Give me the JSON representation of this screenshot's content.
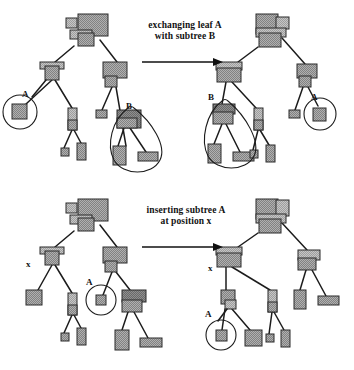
{
  "figure": {
    "background_color": "#ffffff",
    "ink_color": "#1c1c1c",
    "node_fill_light": "#b9b9b9",
    "node_fill_mid": "#a0a0a0",
    "node_fill_dark": "#8a8a8a"
  },
  "panels": [
    {
      "id": "exchange",
      "caption_line1": "exchanging leaf A",
      "caption_line2": "with subtree B",
      "arrow": "right-arrow",
      "labels_left": [
        "A",
        "B"
      ],
      "labels_right": [
        "B",
        "A"
      ],
      "annotations": [
        "circle-around-leaf-A",
        "teardrop-around-subtree-B"
      ]
    },
    {
      "id": "insert",
      "caption_line1": "inserting subtree A",
      "caption_line2": "at position x",
      "arrow": "right-arrow",
      "labels_left": [
        "x",
        "A"
      ],
      "labels_right": [
        "x",
        "A"
      ],
      "annotations": [
        "circle-around-leaf-A"
      ]
    }
  ],
  "trees": {
    "top_left": {
      "name": "before-exchange-tree",
      "nodes": [
        {
          "id": "r",
          "x": 78,
          "y": 14,
          "w": 30,
          "h": 22,
          "shade": "mid"
        },
        {
          "id": "r2",
          "x": 66,
          "y": 18,
          "w": 11,
          "h": 10,
          "shade": "light"
        },
        {
          "id": "r3",
          "x": 70,
          "y": 30,
          "w": 22,
          "h": 9,
          "shade": "light"
        },
        {
          "id": "r4",
          "x": 78,
          "y": 33,
          "w": 16,
          "h": 13,
          "shade": "mid"
        },
        {
          "id": "l1",
          "x": 40,
          "y": 62,
          "w": 24,
          "h": 7,
          "shade": "light"
        },
        {
          "id": "l2",
          "x": 45,
          "y": 66,
          "w": 14,
          "h": 14,
          "shade": "mid"
        },
        {
          "id": "l3",
          "x": 12,
          "y": 104,
          "w": 15,
          "h": 15,
          "shade": "mid"
        },
        {
          "id": "l4",
          "x": 68,
          "y": 108,
          "w": 9,
          "h": 22,
          "shade": "light"
        },
        {
          "id": "l5",
          "x": 68,
          "y": 120,
          "w": 9,
          "h": 10,
          "shade": "mid"
        },
        {
          "id": "l6",
          "x": 61,
          "y": 148,
          "w": 8,
          "h": 8,
          "shade": "mid"
        },
        {
          "id": "l7",
          "x": 77,
          "y": 143,
          "w": 9,
          "h": 17,
          "shade": "mid"
        },
        {
          "id": "c1",
          "x": 103,
          "y": 62,
          "w": 24,
          "h": 16,
          "shade": "mid"
        },
        {
          "id": "c2",
          "x": 105,
          "y": 76,
          "w": 12,
          "h": 11,
          "shade": "mid"
        },
        {
          "id": "c3",
          "x": 96,
          "y": 110,
          "w": 11,
          "h": 8,
          "shade": "mid"
        },
        {
          "id": "b1",
          "x": 117,
          "y": 110,
          "w": 24,
          "h": 18,
          "shade": "dark"
        },
        {
          "id": "b2",
          "x": 117,
          "y": 118,
          "w": 20,
          "h": 10,
          "shade": "mid"
        },
        {
          "id": "b3",
          "x": 113,
          "y": 146,
          "w": 13,
          "h": 19,
          "shade": "mid"
        },
        {
          "id": "b4",
          "x": 138,
          "y": 152,
          "w": 20,
          "h": 9,
          "shade": "mid"
        }
      ],
      "edges": [
        [
          74,
          46,
          55,
          62
        ],
        [
          100,
          40,
          117,
          62
        ],
        [
          52,
          80,
          26,
          104
        ],
        [
          55,
          80,
          72,
          108
        ],
        [
          72,
          130,
          64,
          148
        ],
        [
          74,
          130,
          81,
          143
        ],
        [
          112,
          87,
          102,
          110
        ],
        [
          116,
          87,
          126,
          146
        ],
        [
          124,
          128,
          118,
          146
        ],
        [
          130,
          128,
          146,
          152
        ]
      ]
    },
    "top_right": {
      "name": "after-exchange-tree",
      "nodes": [
        {
          "id": "r",
          "x": 256,
          "y": 14,
          "w": 22,
          "h": 20,
          "shade": "mid"
        },
        {
          "id": "r2",
          "x": 276,
          "y": 17,
          "w": 13,
          "h": 12,
          "shade": "light"
        },
        {
          "id": "r3",
          "x": 256,
          "y": 28,
          "w": 30,
          "h": 9,
          "shade": "light"
        },
        {
          "id": "r4",
          "x": 259,
          "y": 33,
          "w": 22,
          "h": 14,
          "shade": "mid"
        },
        {
          "id": "l1",
          "x": 216,
          "y": 62,
          "w": 26,
          "h": 8,
          "shade": "light"
        },
        {
          "id": "l2",
          "x": 217,
          "y": 68,
          "w": 24,
          "h": 14,
          "shade": "mid"
        },
        {
          "id": "b1",
          "x": 213,
          "y": 104,
          "w": 22,
          "h": 10,
          "shade": "dark"
        },
        {
          "id": "b2",
          "x": 213,
          "y": 112,
          "w": 20,
          "h": 12,
          "shade": "mid"
        },
        {
          "id": "b3",
          "x": 208,
          "y": 144,
          "w": 13,
          "h": 19,
          "shade": "mid"
        },
        {
          "id": "b4",
          "x": 233,
          "y": 152,
          "w": 21,
          "h": 9,
          "shade": "mid"
        },
        {
          "id": "m1",
          "x": 254,
          "y": 108,
          "w": 9,
          "h": 22,
          "shade": "light"
        },
        {
          "id": "m2",
          "x": 254,
          "y": 120,
          "w": 9,
          "h": 10,
          "shade": "mid"
        },
        {
          "id": "m3",
          "x": 250,
          "y": 150,
          "w": 8,
          "h": 8,
          "shade": "mid"
        },
        {
          "id": "m4",
          "x": 266,
          "y": 145,
          "w": 9,
          "h": 17,
          "shade": "mid"
        },
        {
          "id": "c1",
          "x": 297,
          "y": 64,
          "w": 20,
          "h": 14,
          "shade": "mid"
        },
        {
          "id": "c2",
          "x": 299,
          "y": 76,
          "w": 12,
          "h": 11,
          "shade": "mid"
        },
        {
          "id": "c3",
          "x": 289,
          "y": 110,
          "w": 11,
          "h": 8,
          "shade": "mid"
        },
        {
          "id": "a1",
          "x": 313,
          "y": 108,
          "w": 13,
          "h": 13,
          "shade": "mid"
        }
      ],
      "edges": [
        [
          258,
          47,
          238,
          62
        ],
        [
          282,
          38,
          305,
          64
        ],
        [
          226,
          82,
          222,
          104
        ],
        [
          232,
          82,
          256,
          108
        ],
        [
          222,
          124,
          214,
          144
        ],
        [
          226,
          124,
          240,
          152
        ],
        [
          258,
          130,
          253,
          150
        ],
        [
          260,
          130,
          269,
          145
        ],
        [
          303,
          87,
          295,
          110
        ],
        [
          308,
          87,
          318,
          106
        ]
      ]
    },
    "bottom_left": {
      "name": "before-insert-tree",
      "nodes": [
        {
          "id": "r",
          "x": 78,
          "y": 199,
          "w": 30,
          "h": 22,
          "shade": "mid"
        },
        {
          "id": "r2",
          "x": 66,
          "y": 203,
          "w": 11,
          "h": 10,
          "shade": "light"
        },
        {
          "id": "r3",
          "x": 70,
          "y": 215,
          "w": 22,
          "h": 9,
          "shade": "light"
        },
        {
          "id": "r4",
          "x": 78,
          "y": 218,
          "w": 16,
          "h": 13,
          "shade": "mid"
        },
        {
          "id": "l1",
          "x": 40,
          "y": 247,
          "w": 24,
          "h": 7,
          "shade": "light"
        },
        {
          "id": "l2",
          "x": 45,
          "y": 251,
          "w": 14,
          "h": 14,
          "shade": "mid"
        },
        {
          "id": "l3",
          "x": 26,
          "y": 290,
          "w": 16,
          "h": 15,
          "shade": "mid"
        },
        {
          "id": "l4",
          "x": 68,
          "y": 293,
          "w": 9,
          "h": 22,
          "shade": "light"
        },
        {
          "id": "l5",
          "x": 68,
          "y": 305,
          "w": 9,
          "h": 10,
          "shade": "mid"
        },
        {
          "id": "l6",
          "x": 61,
          "y": 333,
          "w": 8,
          "h": 8,
          "shade": "mid"
        },
        {
          "id": "l7",
          "x": 77,
          "y": 328,
          "w": 9,
          "h": 17,
          "shade": "mid"
        },
        {
          "id": "c1",
          "x": 103,
          "y": 247,
          "w": 24,
          "h": 16,
          "shade": "mid"
        },
        {
          "id": "c2",
          "x": 105,
          "y": 261,
          "w": 12,
          "h": 11,
          "shade": "mid"
        },
        {
          "id": "a1",
          "x": 96,
          "y": 295,
          "w": 10,
          "h": 10,
          "shade": "mid"
        },
        {
          "id": "b1",
          "x": 122,
          "y": 290,
          "w": 24,
          "h": 12,
          "shade": "dark"
        },
        {
          "id": "b2",
          "x": 122,
          "y": 300,
          "w": 20,
          "h": 12,
          "shade": "mid"
        },
        {
          "id": "b3",
          "x": 115,
          "y": 330,
          "w": 14,
          "h": 20,
          "shade": "mid"
        },
        {
          "id": "b4",
          "x": 140,
          "y": 338,
          "w": 22,
          "h": 9,
          "shade": "mid"
        }
      ],
      "edges": [
        [
          74,
          231,
          55,
          247
        ],
        [
          100,
          225,
          117,
          247
        ],
        [
          52,
          265,
          38,
          290
        ],
        [
          55,
          265,
          72,
          293
        ],
        [
          72,
          315,
          64,
          333
        ],
        [
          74,
          315,
          81,
          328
        ],
        [
          112,
          272,
          103,
          295
        ],
        [
          116,
          272,
          130,
          290
        ],
        [
          128,
          312,
          122,
          330
        ],
        [
          134,
          312,
          148,
          338
        ]
      ]
    },
    "bottom_right": {
      "name": "after-insert-tree",
      "nodes": [
        {
          "id": "r",
          "x": 256,
          "y": 199,
          "w": 22,
          "h": 20,
          "shade": "mid"
        },
        {
          "id": "r2",
          "x": 276,
          "y": 200,
          "w": 13,
          "h": 16,
          "shade": "light"
        },
        {
          "id": "r3",
          "x": 256,
          "y": 214,
          "w": 30,
          "h": 9,
          "shade": "light"
        },
        {
          "id": "r4",
          "x": 259,
          "y": 219,
          "w": 22,
          "h": 14,
          "shade": "mid"
        },
        {
          "id": "l1",
          "x": 216,
          "y": 247,
          "w": 26,
          "h": 8,
          "shade": "light"
        },
        {
          "id": "l2",
          "x": 217,
          "y": 253,
          "w": 24,
          "h": 14,
          "shade": "mid"
        },
        {
          "id": "x1",
          "x": 221,
          "y": 290,
          "w": 14,
          "h": 14,
          "shade": "mid"
        },
        {
          "id": "x2",
          "x": 225,
          "y": 300,
          "w": 11,
          "h": 9,
          "shade": "light"
        },
        {
          "id": "a1",
          "x": 216,
          "y": 330,
          "w": 11,
          "h": 11,
          "shade": "mid"
        },
        {
          "id": "a2",
          "x": 245,
          "y": 330,
          "w": 17,
          "h": 16,
          "shade": "mid"
        },
        {
          "id": "m1",
          "x": 268,
          "y": 290,
          "w": 9,
          "h": 22,
          "shade": "light"
        },
        {
          "id": "m2",
          "x": 268,
          "y": 302,
          "w": 9,
          "h": 10,
          "shade": "mid"
        },
        {
          "id": "m3",
          "x": 266,
          "y": 334,
          "w": 8,
          "h": 8,
          "shade": "mid"
        },
        {
          "id": "m4",
          "x": 281,
          "y": 330,
          "w": 9,
          "h": 17,
          "shade": "mid"
        },
        {
          "id": "c1",
          "x": 298,
          "y": 250,
          "w": 22,
          "h": 10,
          "shade": "light"
        },
        {
          "id": "c2",
          "x": 298,
          "y": 258,
          "w": 18,
          "h": 12,
          "shade": "mid"
        },
        {
          "id": "c3",
          "x": 294,
          "y": 290,
          "w": 12,
          "h": 19,
          "shade": "mid"
        },
        {
          "id": "c4",
          "x": 318,
          "y": 296,
          "w": 21,
          "h": 9,
          "shade": "mid"
        }
      ],
      "edges": [
        [
          258,
          233,
          238,
          247
        ],
        [
          282,
          223,
          307,
          250
        ],
        [
          226,
          267,
          226,
          290
        ],
        [
          232,
          267,
          270,
          290
        ],
        [
          225,
          309,
          222,
          330
        ],
        [
          232,
          309,
          250,
          330
        ],
        [
          272,
          312,
          269,
          334
        ],
        [
          274,
          312,
          284,
          330
        ],
        [
          306,
          270,
          300,
          290
        ],
        [
          312,
          270,
          326,
          296
        ]
      ]
    }
  }
}
